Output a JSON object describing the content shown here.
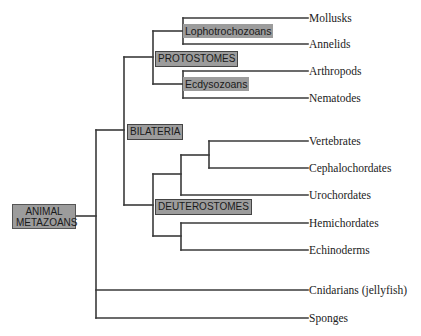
{
  "diagram": {
    "type": "phylogenetic-tree",
    "line_color": "#3a3a3a",
    "label_bg": "#9c9c9c",
    "root": {
      "label_line1": "ANIMAL",
      "label_line2": "METAZOANS"
    },
    "clades": {
      "bilateria": "BILATERIA",
      "protostomes": "PROTOSTOMES",
      "lophotrochozoans": "Lophotrochozoans",
      "ecdysozoans": "Ecdysozoans",
      "deuterostomes": "DEUTEROSTOMES"
    },
    "taxa": [
      "Mollusks",
      "Annelids",
      "Arthropods",
      "Nematodes",
      "Vertebrates",
      "Cephalochordates",
      "Urochordates",
      "Hemichordates",
      "Echinoderms",
      "Cnidarians (jellyfish)",
      "Sponges"
    ]
  }
}
